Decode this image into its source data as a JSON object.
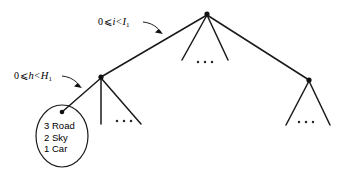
{
  "figure": {
    "type": "tree-diagram",
    "background_color": "#ffffff",
    "line_color": "#1a1a1a",
    "text_color": "#000000",
    "width": 346,
    "height": 176
  },
  "labels": {
    "i_range": {
      "zero": "0",
      "le": "⩽",
      "var": "i",
      "lt": "<",
      "bound": "I",
      "bound_sub": "1",
      "full_text": "0 ⩽ i < I₁"
    },
    "h_range": {
      "zero": "0",
      "le": "⩽",
      "var": "h",
      "lt": "<",
      "bound": "H",
      "bound_sub": "1",
      "full_text": "0 ⩽ h < H₁"
    }
  },
  "leaf_node": {
    "name": "ranked-label-list",
    "items": [
      {
        "rank": "3",
        "label": "Road"
      },
      {
        "rank": "2",
        "label": "Sky"
      },
      {
        "rank": "1",
        "label": "Car"
      }
    ]
  },
  "tree": {
    "root": {
      "x": 207,
      "y": 14
    },
    "children": [
      {
        "name": "left-child",
        "x": 101,
        "y": 77
      },
      {
        "name": "middle-child-a",
        "x": 182,
        "y": 60
      },
      {
        "name": "middle-child-b",
        "x": 228,
        "y": 60
      },
      {
        "name": "right-child",
        "x": 309,
        "y": 80
      }
    ]
  },
  "ellipsis": {
    "glyph": "·",
    "groups": [
      {
        "name": "ellipsis-middle",
        "x": 205,
        "y": 62
      },
      {
        "name": "ellipsis-left-subtree",
        "x": 124,
        "y": 121
      },
      {
        "name": "ellipsis-right-subtree",
        "x": 306,
        "y": 122
      }
    ]
  }
}
